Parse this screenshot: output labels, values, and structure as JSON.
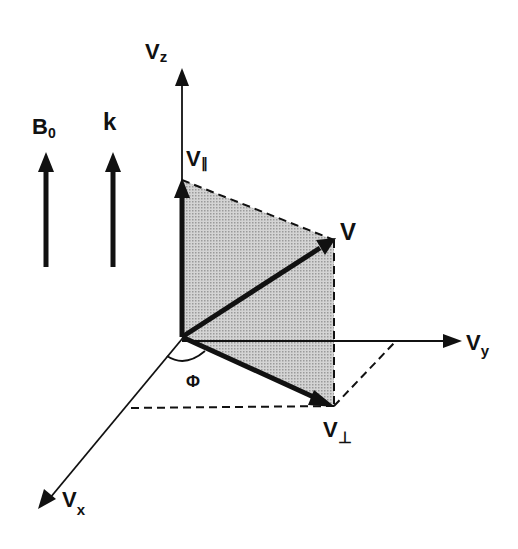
{
  "diagram": {
    "type": "3d-velocity-vector-decomposition",
    "reference_arrows": [
      {
        "label": "B",
        "subscript": "0"
      },
      {
        "label": "k",
        "subscript": ""
      }
    ],
    "axes": {
      "z": {
        "label": "V",
        "subscript": "z"
      },
      "y": {
        "label": "V",
        "subscript": "y"
      },
      "x": {
        "label": "V",
        "subscript": "x"
      }
    },
    "vectors": {
      "parallel": {
        "label": "V",
        "subscript": "∥"
      },
      "total": {
        "label": "V",
        "subscript": ""
      },
      "perpendicular": {
        "label": "V",
        "subscript": "⊥"
      }
    },
    "angle": {
      "label": "Φ"
    },
    "colors": {
      "ink": "#111111",
      "shaded_plane": "#c8c8c8",
      "background": "#ffffff"
    }
  }
}
